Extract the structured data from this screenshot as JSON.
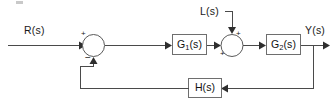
{
  "diagram": {
    "type": "control-system-block-diagram",
    "background_color": "#ffffff",
    "line_color": "#4a4a4a",
    "block_border_color": "#6e6e6e",
    "text_color": "#1a1a1a",
    "inputs": [
      {
        "id": "reference",
        "label": "R(s)",
        "position": "left"
      },
      {
        "id": "disturbance",
        "label": "L(s)",
        "position": "top"
      }
    ],
    "outputs": [
      {
        "id": "output",
        "label": "Y(s)",
        "position": "right"
      }
    ],
    "blocks": [
      {
        "id": "g1",
        "label": "G",
        "subscript": "1",
        "suffix": "(s)",
        "full_label": "G1(s)",
        "path": "forward"
      },
      {
        "id": "g2",
        "label": "G",
        "subscript": "2",
        "suffix": "(s)",
        "full_label": "G2(s)",
        "path": "forward"
      },
      {
        "id": "h",
        "label": "H(s)",
        "subscript": "",
        "suffix": "",
        "full_label": "H(s)",
        "path": "feedback"
      }
    ],
    "summing_junctions": [
      {
        "id": "sum1",
        "signs": {
          "left_input": "+",
          "bottom_input": "−"
        },
        "inputs": [
          "R(s)",
          "feedback from H(s)"
        ],
        "output": "to G1(s)"
      },
      {
        "id": "sum2",
        "signs": {
          "left_input": "+",
          "top_input": "+"
        },
        "inputs": [
          "G1(s) output",
          "L(s)"
        ],
        "output": "to G2(s)"
      }
    ],
    "signal_flow": "R(s) -> sum1(+) -> G1(s) -> sum2(+) -> G2(s) -> Y(s); L(s) -> sum2(+); Y(s) -> H(s) -> sum1(-)"
  }
}
